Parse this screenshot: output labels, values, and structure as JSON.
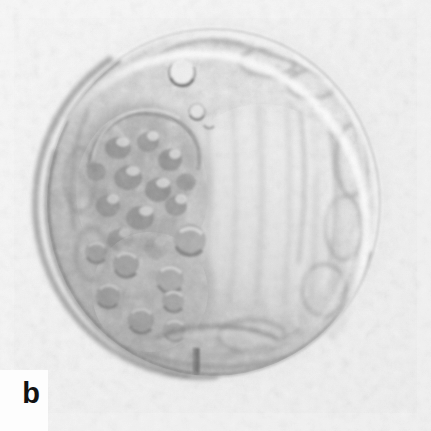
{
  "figure": {
    "panel_label": "b",
    "caption_text": "",
    "width_px": 431,
    "height_px": 431,
    "modality": "differential-interference-contrast-light-micrograph",
    "background_color": "#f2f2f2",
    "label_color": "#121212",
    "label_backdrop_color": "#fdfdfd"
  },
  "specimen": {
    "name": "blastocyst",
    "outline": {
      "center_x": 213,
      "center_y": 203,
      "radius_x": 166,
      "radius_y": 173,
      "bounds": {
        "left": 48,
        "top": 30,
        "right": 379,
        "bottom": 376
      }
    },
    "zona_pellucida": {
      "visible": true,
      "thickness_px": 9,
      "highlight_color": "#fbfbfb",
      "shadow_color": "#7f7f7f"
    },
    "illumination": {
      "type": "dic-oblique",
      "azimuth_degrees": 45,
      "highlight_side": "upper-right",
      "shadow_side": "lower-left"
    },
    "regions": [
      {
        "name": "inner-cell-mass",
        "description": "dense granular cell cluster",
        "center_x": 140,
        "center_y": 190,
        "radius_x": 72,
        "radius_y": 88,
        "tone": "#8c8c8c"
      },
      {
        "name": "blastocoel-cavity",
        "description": "bright fluid-filled cavity",
        "center_x": 262,
        "center_y": 212,
        "radius_x": 96,
        "radius_y": 108,
        "tone": "#f0f0f0"
      },
      {
        "name": "trophectoderm-rim",
        "description": "thin outer cell layer",
        "tone": "#bdbdbd"
      },
      {
        "name": "vesicle-cluster",
        "description": "rounded blebs lower-left quadrant",
        "center_x": 152,
        "center_y": 290,
        "radius_x": 62,
        "radius_y": 64,
        "tone": "#9a9a9a"
      }
    ],
    "features": [
      {
        "name": "bright-vacuole",
        "cx": 182,
        "cy": 73,
        "r": 13,
        "fill": "#fdfdfd",
        "rim": "#585858"
      },
      {
        "name": "small-vacuole",
        "cx": 197,
        "cy": 112,
        "r": 8,
        "fill": "#efefef",
        "rim": "#6e6e6e"
      },
      {
        "name": "vesicle-a",
        "cx": 190,
        "cy": 240,
        "r": 16,
        "fill": "#b4b4b4",
        "rim": "#6a6a6a"
      },
      {
        "name": "vesicle-b",
        "cx": 170,
        "cy": 278,
        "r": 13,
        "fill": "#aeaeae",
        "rim": "#6f6f6f"
      },
      {
        "name": "vesicle-c",
        "cx": 172,
        "cy": 300,
        "r": 11,
        "fill": "#a8a8a8",
        "rim": "#707070"
      },
      {
        "name": "basal-cleft",
        "cx": 215,
        "cy": 345,
        "rx": 62,
        "ry": 14,
        "rim": "#6b6b6b"
      },
      {
        "name": "pipette-streak",
        "x": 196,
        "y_top": 352,
        "y_bottom": 400,
        "width": 6,
        "color": "#5a5a5a"
      },
      {
        "name": "protrusion-left",
        "x": 128,
        "y_top": 352,
        "y_bottom": 392,
        "width": 9,
        "color": "#8a8a8a"
      }
    ]
  },
  "icons": {
    "panel_label_icon": "letter-b-glyph"
  }
}
